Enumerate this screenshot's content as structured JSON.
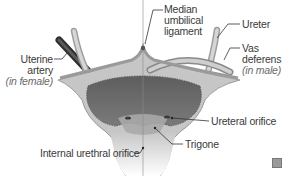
{
  "diagram": {
    "labels": {
      "median_umbilical_ligament": [
        "Median",
        "umbilical",
        "ligament"
      ],
      "ureter": "Ureter",
      "vas_deferens": [
        "Vas",
        "deferens"
      ],
      "vas_deferens_note": "(in male)",
      "uterine_artery": [
        "Uterine",
        "artery"
      ],
      "uterine_artery_note": "(in female)",
      "ureteral_orifice": "Ureteral orifice",
      "trigone": "Trigone",
      "internal_urethral_orifice": "Internal urethral orifice"
    },
    "colors": {
      "outer_wall": "#c9c9c9",
      "inner_lumen": "#6e6e6e",
      "trigone_area": "#a8a8a8",
      "ureter": "#bdbdbd",
      "uterine_artery": "#3c3c3c",
      "leader_line": "#333333",
      "text": "#3a3a3a"
    },
    "corner_icon": "magnify-icon"
  }
}
